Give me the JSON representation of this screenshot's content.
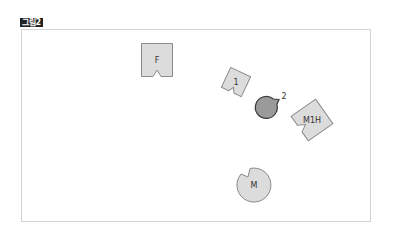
{
  "figure": {
    "label": "그림2"
  },
  "colors": {
    "shape_fill": "#dcdcdc",
    "shape_stroke": "#8a8a8a",
    "dark_fill": "#9a9a9a",
    "dark_stroke": "#3a3a3a",
    "frame_border": "#d4d4d4",
    "label_bg": "#222222"
  },
  "shapes": [
    {
      "id": "F",
      "label": "F",
      "type": "notched-rect",
      "cx": 157,
      "cy": 60,
      "w": 31,
      "h": 33,
      "rotate": 0,
      "notch": "bottom"
    },
    {
      "id": "1",
      "label": "1",
      "type": "notched-rect",
      "cx": 236,
      "cy": 82,
      "w": 22,
      "h": 22,
      "rotate": 25,
      "notch": "bottom"
    },
    {
      "id": "2",
      "label": "2",
      "type": "notched-circle",
      "cx": 284,
      "cy": 96,
      "r": 11,
      "notch": "bottom-left",
      "dark": true
    },
    {
      "id": "M1H",
      "label": "M1H",
      "type": "notched-rect",
      "cx": 312,
      "cy": 120,
      "w": 30,
      "h": 30,
      "rotate": -35,
      "notch": "left"
    },
    {
      "id": "M",
      "label": "M",
      "type": "notched-circle",
      "cx": 254,
      "cy": 185,
      "r": 17,
      "notch": "top-left"
    }
  ]
}
